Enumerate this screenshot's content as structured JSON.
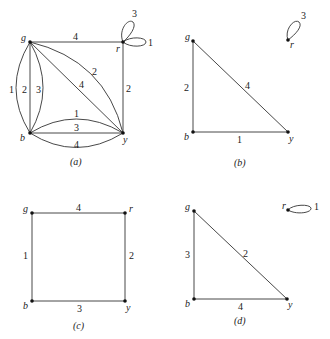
{
  "figure": {
    "panels": [
      {
        "id": "a",
        "caption": "(a)",
        "nodes": {
          "g": "g",
          "r": "r",
          "b": "b",
          "y": "y"
        },
        "edges": [
          {
            "from": "g",
            "to": "r",
            "label": "4"
          },
          {
            "from": "r",
            "to": "y",
            "label": "2"
          },
          {
            "from": "g",
            "to": "b",
            "label": "1"
          },
          {
            "from": "g",
            "to": "b",
            "label": "2"
          },
          {
            "from": "g",
            "to": "b",
            "label": "3"
          },
          {
            "from": "g",
            "to": "y",
            "label": "4"
          },
          {
            "from": "g",
            "to": "y",
            "label": "2"
          },
          {
            "from": "b",
            "to": "y",
            "label": "1"
          },
          {
            "from": "b",
            "to": "y",
            "label": "3"
          },
          {
            "from": "b",
            "to": "y",
            "label": "4"
          },
          {
            "from": "r",
            "to": "r",
            "label": "3"
          },
          {
            "from": "r",
            "to": "r",
            "label": "1"
          }
        ]
      },
      {
        "id": "b",
        "caption": "(b)",
        "nodes": {
          "g": "g",
          "r": "r",
          "b": "b",
          "y": "y"
        },
        "edges": [
          {
            "from": "g",
            "to": "b",
            "label": "2"
          },
          {
            "from": "g",
            "to": "y",
            "label": "4"
          },
          {
            "from": "b",
            "to": "y",
            "label": "1"
          },
          {
            "from": "r",
            "to": "r",
            "label": "3"
          }
        ]
      },
      {
        "id": "c",
        "caption": "(c)",
        "nodes": {
          "g": "g",
          "r": "r",
          "b": "b",
          "y": "y"
        },
        "edges": [
          {
            "from": "g",
            "to": "r",
            "label": "4"
          },
          {
            "from": "g",
            "to": "b",
            "label": "1"
          },
          {
            "from": "r",
            "to": "y",
            "label": "2"
          },
          {
            "from": "b",
            "to": "y",
            "label": "3"
          }
        ]
      },
      {
        "id": "d",
        "caption": "(d)",
        "nodes": {
          "g": "g",
          "r": "r",
          "b": "b",
          "y": "y"
        },
        "edges": [
          {
            "from": "g",
            "to": "b",
            "label": "3"
          },
          {
            "from": "g",
            "to": "y",
            "label": "2"
          },
          {
            "from": "b",
            "to": "y",
            "label": "4"
          },
          {
            "from": "r",
            "to": "r",
            "label": "1"
          }
        ]
      }
    ]
  }
}
